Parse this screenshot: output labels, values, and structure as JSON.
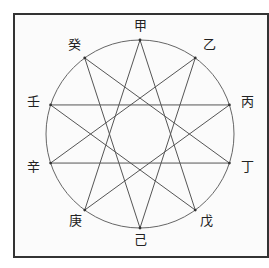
{
  "diagram": {
    "title": "",
    "type": "ten heavenly stems star {10/4}",
    "circle": {
      "cx": 140,
      "cy": 134,
      "r": 94
    },
    "stems": [
      {
        "id": 0,
        "label": "甲",
        "angle": 0
      },
      {
        "id": 1,
        "label": "乙",
        "angle": 36
      },
      {
        "id": 2,
        "label": "丙",
        "angle": 72
      },
      {
        "id": 3,
        "label": "丁",
        "angle": 108
      },
      {
        "id": 4,
        "label": "戊",
        "angle": 144
      },
      {
        "id": 5,
        "label": "己",
        "angle": 180
      },
      {
        "id": 6,
        "label": "庚",
        "angle": 216
      },
      {
        "id": 7,
        "label": "辛",
        "angle": 252
      },
      {
        "id": 8,
        "label": "壬",
        "angle": 288
      },
      {
        "id": 9,
        "label": "癸",
        "angle": 324
      }
    ],
    "edges": [
      [
        0,
        4
      ],
      [
        1,
        5
      ],
      [
        2,
        6
      ],
      [
        3,
        7
      ],
      [
        4,
        8
      ],
      [
        5,
        9
      ],
      [
        6,
        0
      ],
      [
        7,
        1
      ],
      [
        8,
        2
      ],
      [
        9,
        3
      ]
    ],
    "colors": {
      "line": "#555555",
      "circle": "#666666",
      "frame": "#333333",
      "text": "#222222"
    }
  }
}
